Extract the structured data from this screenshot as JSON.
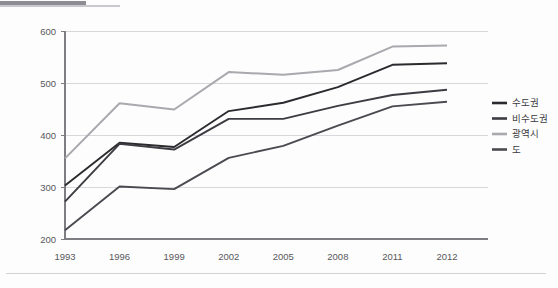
{
  "chart_data": {
    "type": "line",
    "title": "",
    "subtitle": "",
    "xlabel": "",
    "ylabel": "",
    "categories": [
      "1993",
      "1996",
      "1999",
      "2002",
      "2005",
      "2008",
      "2011",
      "2012"
    ],
    "ylim": [
      200,
      600
    ],
    "yticks": [
      200,
      300,
      400,
      500,
      600
    ],
    "ytick_labels": [
      "200",
      "300",
      "400",
      "500",
      "600"
    ],
    "grid": true,
    "legend_position": "right",
    "series": [
      {
        "name": "수도권",
        "color": "#2b2b2f",
        "values": [
          303,
          385,
          377,
          446,
          462,
          492,
          535,
          538
        ]
      },
      {
        "name": "비수도권",
        "color": "#3c3c42",
        "values": [
          272,
          383,
          372,
          431,
          431,
          456,
          477,
          487
        ]
      },
      {
        "name": "광역시",
        "color": "#a9a9ae",
        "values": [
          355,
          461,
          449,
          521,
          516,
          525,
          570,
          572
        ]
      },
      {
        "name": "도",
        "color": "#4a4a50",
        "values": [
          217,
          301,
          296,
          356,
          379,
          418,
          455,
          464
        ]
      }
    ]
  },
  "legend": {
    "items": [
      {
        "label": "수도권",
        "swatch_color": "#2b2b2f"
      },
      {
        "label": "비수도권",
        "swatch_color": "#3c3c42"
      },
      {
        "label": "광역시",
        "swatch_color": "#a9a9ae"
      },
      {
        "label": "도",
        "swatch_color": "#4a4a50"
      }
    ]
  },
  "decor": {
    "top_rule_color": "#8d8d93",
    "top_rule_light_color": "#c9c9cd",
    "bottom_rule_color": "#d2d2d6",
    "grid_color": "#d8d8dc",
    "axis_color": "#7d7d82",
    "tick_text_color": "#58585c"
  }
}
